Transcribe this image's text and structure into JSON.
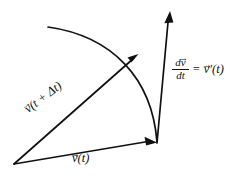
{
  "figure": {
    "background_color": "#ffffff",
    "stroke_color": "#111111",
    "text_color": "#111111"
  },
  "labels": {
    "v_t_plus_delta_t": {
      "vec_symbol": "v",
      "accent": "→",
      "text": "(t + Δt)"
    },
    "v_t": {
      "vec_symbol": "v",
      "accent": "→",
      "text": "(t)"
    },
    "derivative": {
      "numerator_d": "d",
      "numerator_vec": "v",
      "numerator_accent": "→",
      "denominator": "dt",
      "equals": "=",
      "rhs_vec": "v",
      "rhs_accent": "→",
      "rhs_text": "′(t)"
    }
  },
  "geometry": {
    "origin": {
      "x": 14,
      "y": 164
    },
    "convergence_point": {
      "x": 157,
      "y": 143
    },
    "vector_v_t_plus_delta_t_tip": {
      "x": 137,
      "y": 55
    },
    "vector_v_t_tip": {
      "x": 156,
      "y": 142
    },
    "derivative_arrow_tip": {
      "x": 170,
      "y": 11
    },
    "arc_start": {
      "x": 48,
      "y": 27
    },
    "arc_end": {
      "x": 157,
      "y": 142
    },
    "arc_control_1": {
      "x": 112,
      "y": 36
    },
    "arc_control_2": {
      "x": 152,
      "y": 78
    },
    "stroke_width": 1.7
  }
}
